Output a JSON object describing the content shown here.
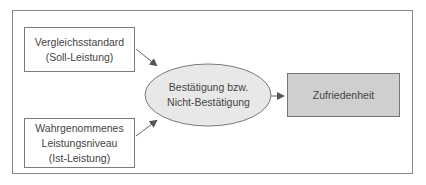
{
  "diagram": {
    "type": "flow",
    "nodes": [
      {
        "id": "standard",
        "shape": "rectangle",
        "lines": [
          "Vergleichsstandard",
          "(Soll-Leistung)"
        ]
      },
      {
        "id": "perceived",
        "shape": "rectangle",
        "lines": [
          "Wahrgenommenes",
          "Leistungsniveau",
          "(Ist-Leistung)"
        ]
      },
      {
        "id": "confirmation",
        "shape": "ellipse",
        "lines": [
          "Bestätigung bzw.",
          "Nicht-Bestätigung"
        ]
      },
      {
        "id": "result",
        "shape": "rectangle",
        "fill": "#cfcfcf",
        "lines": [
          "Zufriedenheit"
        ]
      }
    ],
    "edges": [
      {
        "from": "standard",
        "to": "confirmation"
      },
      {
        "from": "perceived",
        "to": "confirmation"
      },
      {
        "from": "confirmation",
        "to": "result"
      }
    ],
    "colors": {
      "frame": "#8a8a8a",
      "ellipse_fill": "#e8e8e8",
      "result_fill": "#cfcfcf",
      "arrow": "#555555"
    }
  }
}
